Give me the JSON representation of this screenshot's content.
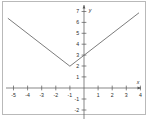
{
  "chart_data": {
    "type": "line",
    "title": "",
    "subtitle": "",
    "xlabel": "x",
    "ylabel": "y",
    "xlim": [
      -5.6,
      4.2
    ],
    "ylim": [
      -2.6,
      7.4
    ],
    "grid": false,
    "legend": null,
    "x_ticks": [
      -5,
      -4,
      -3,
      -2,
      -1,
      1,
      2,
      3,
      4
    ],
    "x_tick_labels": [
      "-5",
      "-4",
      "-3",
      "-2",
      "-1",
      "1",
      "2",
      "3",
      "4"
    ],
    "y_ticks": [
      -2,
      -1,
      1,
      2,
      3,
      4,
      5,
      6,
      7
    ],
    "y_tick_labels": [
      "-2",
      "-1",
      "1",
      "2",
      "3",
      "4",
      "5",
      "6",
      "7"
    ],
    "series": [
      {
        "name": "y = |x + 1| + 2",
        "shape": "v-shaped absolute value",
        "vertex": [
          -1,
          2
        ],
        "y_intercept": 3,
        "x": [
          -5.4,
          -1,
          3.9
        ],
        "values": [
          6.4,
          2,
          6.9
        ],
        "color": "#6d6d6d"
      }
    ],
    "annotations": []
  },
  "figure": {
    "border_color": "#b9b9b9",
    "background": "#ffffff",
    "axis_color": "#555555",
    "tick_label_color": "#2b2b2b"
  }
}
